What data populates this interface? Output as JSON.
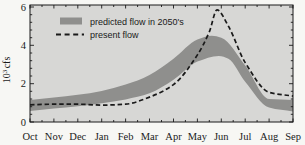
{
  "figure": {
    "background": "#f7f7f4",
    "plot_background": "#d7d7d5",
    "frame_color": "#1a1a1a",
    "tick_color": "#1a1a1a"
  },
  "legend": {
    "items": [
      {
        "label": "predicted flow in 2050's",
        "swatch": "filled-band",
        "color": "#8f8f8d"
      },
      {
        "label": "present flow",
        "swatch": "dashed-line",
        "color": "#1a1a1a"
      }
    ]
  },
  "y_axis": {
    "title_base": "10",
    "title_exponent": "3",
    "title_unit": "cfs",
    "tick_labels": [
      "0",
      "2",
      "4",
      "6"
    ]
  },
  "x_axis": {
    "tick_labels": [
      "Oct",
      "Nov",
      "Dec",
      "Jan",
      "Feb",
      "Mar",
      "Apr",
      "May",
      "Jun",
      "Jul",
      "Aug",
      "Sep"
    ]
  },
  "chart_data": {
    "type": "area",
    "title": "",
    "xlabel": "",
    "ylabel": "10^3 cfs",
    "x_categories": [
      "Oct",
      "Nov",
      "Dec",
      "Jan",
      "Feb",
      "Mar",
      "Apr",
      "May",
      "Jun",
      "Jul",
      "Aug",
      "Sep"
    ],
    "x_note": "points given as [month_index, value], Oct=0 … Sep=11, fractional indices mark curve peaks",
    "ylim": [
      0,
      6
    ],
    "y_major_ticks": [
      0,
      2,
      4,
      6
    ],
    "y_minor_step": 0.4,
    "grid": false,
    "legend_position": "top-left-inside",
    "series": [
      {
        "name": "predicted flow in 2050's",
        "type": "band",
        "color": "#8f8f8d",
        "upper": [
          [
            0,
            1.15
          ],
          [
            1,
            1.28
          ],
          [
            2,
            1.42
          ],
          [
            3,
            1.62
          ],
          [
            4,
            1.95
          ],
          [
            5,
            2.45
          ],
          [
            6,
            3.3
          ],
          [
            7,
            4.3
          ],
          [
            7.6,
            4.5
          ],
          [
            8,
            4.4
          ],
          [
            9,
            2.95
          ],
          [
            10,
            1.2
          ],
          [
            11,
            1.15
          ]
        ],
        "lower": [
          [
            0,
            0.58
          ],
          [
            1,
            0.7
          ],
          [
            2,
            0.82
          ],
          [
            3,
            0.98
          ],
          [
            4,
            1.18
          ],
          [
            5,
            1.5
          ],
          [
            6,
            2.2
          ],
          [
            7,
            3.15
          ],
          [
            7.9,
            3.45
          ],
          [
            8.3,
            3.3
          ],
          [
            9,
            2.1
          ],
          [
            10,
            0.75
          ],
          [
            11,
            0.55
          ]
        ],
        "monthly_upper": [
          1.15,
          1.28,
          1.42,
          1.62,
          1.95,
          2.45,
          3.3,
          4.3,
          4.4,
          2.95,
          1.2,
          1.15
        ],
        "monthly_lower": [
          0.58,
          0.7,
          0.82,
          0.98,
          1.18,
          1.5,
          2.2,
          3.15,
          3.42,
          2.1,
          0.75,
          0.55
        ]
      },
      {
        "name": "present flow",
        "type": "line",
        "style": "dashed",
        "color": "#1a1a1a",
        "points": [
          [
            0,
            0.9
          ],
          [
            1,
            0.93
          ],
          [
            2,
            0.93
          ],
          [
            3,
            0.88
          ],
          [
            4,
            0.93
          ],
          [
            5,
            1.3
          ],
          [
            6,
            1.95
          ],
          [
            7,
            3.5
          ],
          [
            7.5,
            4.7
          ],
          [
            7.82,
            5.85
          ],
          [
            8.3,
            5.0
          ],
          [
            9,
            3.1
          ],
          [
            10,
            1.55
          ],
          [
            11,
            1.35
          ]
        ],
        "monthly_values": [
          0.9,
          0.93,
          0.93,
          0.88,
          0.93,
          1.3,
          1.95,
          3.5,
          5.6,
          3.1,
          1.55,
          1.35
        ],
        "peak": {
          "value": 5.85,
          "near_month": "Jun"
        }
      }
    ]
  }
}
